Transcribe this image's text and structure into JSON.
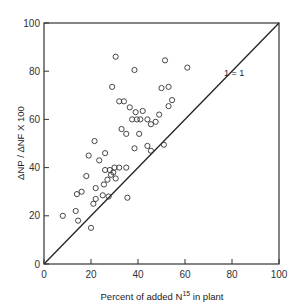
{
  "chart_data": {
    "type": "scatter",
    "title": "",
    "xlabel": "Percent of added N",
    "xlabel_sup": "15",
    "xlabel_suffix": " in plant",
    "ylabel": "ΔNP / ΔNF X 100",
    "xlim": [
      0,
      100
    ],
    "ylim": [
      0,
      100
    ],
    "xticks": [
      0,
      20,
      40,
      60,
      80,
      100
    ],
    "yticks": [
      0,
      20,
      40,
      60,
      80,
      100
    ],
    "grid": false,
    "reference_line": {
      "label": "1 = 1",
      "from": [
        0,
        0
      ],
      "to": [
        100,
        100
      ]
    },
    "series": [
      {
        "name": "observations",
        "marker": "open-circle",
        "points": [
          [
            30.5,
            86
          ],
          [
            38.5,
            80.5
          ],
          [
            51.5,
            84.5
          ],
          [
            61,
            81.5
          ],
          [
            29,
            73.5
          ],
          [
            50,
            73
          ],
          [
            53,
            73.5
          ],
          [
            32,
            67.5
          ],
          [
            34,
            67.5
          ],
          [
            36.5,
            65
          ],
          [
            39,
            63
          ],
          [
            42,
            63.5
          ],
          [
            37.5,
            60
          ],
          [
            39.5,
            60
          ],
          [
            41,
            60
          ],
          [
            44,
            60
          ],
          [
            45.5,
            58
          ],
          [
            47.5,
            59
          ],
          [
            53,
            65.5
          ],
          [
            49,
            62
          ],
          [
            54.5,
            68
          ],
          [
            33,
            56
          ],
          [
            35,
            54
          ],
          [
            40.5,
            54
          ],
          [
            38.5,
            48
          ],
          [
            44,
            49
          ],
          [
            51,
            49.5
          ],
          [
            45.5,
            47
          ],
          [
            21.5,
            51
          ],
          [
            26,
            46
          ],
          [
            19,
            45
          ],
          [
            23.5,
            43
          ],
          [
            18,
            36.5
          ],
          [
            26,
            39
          ],
          [
            28,
            39
          ],
          [
            30,
            40
          ],
          [
            32,
            40
          ],
          [
            35,
            40
          ],
          [
            29.5,
            38
          ],
          [
            28.5,
            37
          ],
          [
            27,
            35
          ],
          [
            30.5,
            35.5
          ],
          [
            25.5,
            33
          ],
          [
            22,
            31.5
          ],
          [
            16,
            30
          ],
          [
            14,
            29
          ],
          [
            25,
            28.5
          ],
          [
            27.5,
            28
          ],
          [
            22,
            27
          ],
          [
            21,
            25
          ],
          [
            35.5,
            27.5
          ],
          [
            8,
            20
          ],
          [
            13.5,
            22
          ],
          [
            14.5,
            18
          ],
          [
            20,
            15
          ]
        ]
      }
    ]
  }
}
